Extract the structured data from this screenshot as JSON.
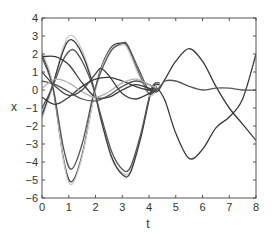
{
  "chart_data": {
    "type": "line",
    "title": "",
    "xlabel": "t",
    "ylabel": "x",
    "xlim": [
      0,
      8
    ],
    "ylim": [
      -6,
      4
    ],
    "xticks": [
      0,
      1,
      2,
      3,
      4,
      5,
      6,
      7,
      8
    ],
    "yticks": [
      -6,
      -5,
      -4,
      -3,
      -2,
      -1,
      0,
      1,
      2,
      3,
      4
    ],
    "xtick_labels": [
      "0",
      "1",
      "2",
      "3",
      "4",
      "5",
      "6",
      "7",
      "8"
    ],
    "ytick_labels": [
      "−6",
      "−5",
      "−4",
      "−3",
      "−2",
      "−1",
      "0",
      "1",
      "2",
      "3",
      "4"
    ],
    "grid": false,
    "legend": null,
    "series": [
      {
        "name": "trajectory-1",
        "color": "#c8c8c8",
        "x": [
          0,
          0.4,
          0.8,
          1.1,
          1.5,
          1.9,
          2.2,
          2.6,
          3.0,
          3.3,
          3.7,
          4.1,
          4.4
        ],
        "values": [
          -1.6,
          0.2,
          2.4,
          3.05,
          2.2,
          0.4,
          -1.6,
          -3.8,
          -4.6,
          -4.5,
          -2.5,
          0.1,
          0.4
        ]
      },
      {
        "name": "trajectory-2",
        "color": "#3a3a3a",
        "x": [
          0,
          0.4,
          0.8,
          1.1,
          1.5,
          1.9,
          2.2,
          2.6,
          3.0,
          3.3,
          3.7,
          4.1,
          4.4
        ],
        "values": [
          -1.4,
          0.3,
          2.2,
          2.8,
          2.0,
          0.3,
          -1.6,
          -3.7,
          -4.7,
          -4.6,
          -2.6,
          0.0,
          0.3
        ]
      },
      {
        "name": "trajectory-3",
        "color": "#555555",
        "x": [
          0,
          0.4,
          0.8,
          1.15,
          1.5,
          1.9,
          2.2,
          2.6,
          3.0,
          3.3,
          3.7,
          4.1,
          4.4
        ],
        "values": [
          -1.0,
          0.2,
          1.7,
          2.25,
          1.6,
          0.2,
          -1.4,
          -3.4,
          -4.4,
          -4.3,
          -2.4,
          0.1,
          0.4
        ]
      },
      {
        "name": "trajectory-4",
        "color": "#3a3a3a",
        "x": [
          0,
          0.4,
          0.8,
          1.1,
          1.5,
          1.9,
          2.2,
          2.6,
          3.0,
          3.2,
          3.6,
          4.0,
          4.3
        ],
        "values": [
          2.0,
          0.2,
          -3.8,
          -5.1,
          -3.6,
          -0.6,
          1.2,
          2.4,
          2.6,
          2.4,
          1.0,
          -0.2,
          0.1
        ]
      },
      {
        "name": "trajectory-5",
        "color": "#c8c8c8",
        "x": [
          0,
          0.4,
          0.8,
          1.1,
          1.5,
          1.9,
          2.2,
          2.6,
          3.0,
          3.2,
          3.6,
          4.0,
          4.3
        ],
        "values": [
          2.1,
          0.4,
          -3.9,
          -5.25,
          -3.7,
          -0.7,
          1.1,
          2.3,
          2.5,
          2.3,
          0.9,
          -0.3,
          0.0
        ]
      },
      {
        "name": "trajectory-6",
        "color": "#555555",
        "x": [
          0,
          0.4,
          0.8,
          1.1,
          1.5,
          1.9,
          2.2,
          2.6,
          3.0,
          3.2,
          3.6,
          4.0,
          4.3
        ],
        "values": [
          1.8,
          0.2,
          -3.2,
          -4.4,
          -3.0,
          -0.4,
          1.0,
          2.2,
          2.6,
          2.5,
          1.2,
          0.0,
          0.2
        ]
      },
      {
        "name": "trajectory-7",
        "color": "#3a3a3a",
        "x": [
          0,
          0.5,
          1.0,
          1.5,
          2.0,
          2.5,
          3.0,
          3.5,
          4.0,
          4.3,
          4.6,
          5.0,
          5.5,
          6.0,
          6.5,
          7.0,
          7.5,
          8.0
        ],
        "values": [
          1.85,
          1.85,
          1.4,
          0.4,
          -0.4,
          -0.4,
          0.0,
          0.3,
          0.1,
          -0.1,
          0.6,
          1.6,
          2.3,
          1.6,
          0.2,
          -1.0,
          -1.9,
          -2.8
        ]
      },
      {
        "name": "trajectory-8",
        "color": "#3a3a3a",
        "x": [
          0,
          0.5,
          1.0,
          1.5,
          2.0,
          2.5,
          3.0,
          3.5,
          4.0,
          4.3,
          4.6,
          5.0,
          5.5,
          6.0,
          6.5,
          7.0,
          7.5,
          8.0
        ],
        "values": [
          -0.4,
          -0.8,
          -0.4,
          0.2,
          0.6,
          0.7,
          0.5,
          0.2,
          0.0,
          0.1,
          -0.6,
          -2.4,
          -3.8,
          -3.3,
          -2.1,
          -1.5,
          -0.5,
          2.0
        ]
      },
      {
        "name": "trajectory-9",
        "color": "#555555",
        "x": [
          0,
          0.5,
          1.0,
          1.5,
          2.0,
          2.5,
          3.0,
          3.5,
          4.0,
          4.3,
          4.6,
          5.0,
          5.5,
          6.0,
          6.5,
          7.0,
          7.5,
          8.0
        ],
        "values": [
          0.5,
          0.3,
          -0.1,
          -0.5,
          -0.6,
          -0.3,
          0.2,
          0.5,
          0.3,
          0.05,
          0.5,
          0.5,
          0.2,
          0.0,
          0.1,
          0.1,
          0.0,
          0.0
        ]
      },
      {
        "name": "trajectory-10",
        "color": "#b0b0b0",
        "x": [
          0,
          0.5,
          1.0,
          1.5,
          2.0,
          2.5,
          3.0,
          3.5,
          4.0,
          4.3
        ],
        "values": [
          0.1,
          0.6,
          0.4,
          -0.1,
          -0.4,
          -0.1,
          0.4,
          0.6,
          0.3,
          0.1
        ]
      },
      {
        "name": "trajectory-11",
        "color": "#444444",
        "x": [
          0,
          0.5,
          1.0,
          1.5,
          2.0,
          2.2,
          2.5,
          3.0,
          3.5,
          4.0,
          4.3
        ],
        "values": [
          1.0,
          0.2,
          -0.3,
          0.0,
          0.9,
          1.2,
          0.8,
          -0.2,
          -0.5,
          -0.2,
          0.0
        ]
      }
    ]
  }
}
